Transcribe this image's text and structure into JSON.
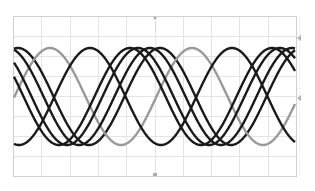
{
  "chart_data": {
    "type": "line",
    "title": "",
    "xlabel": "",
    "ylabel": "",
    "grid": true,
    "legend": null,
    "plot_frame_px": {
      "left": 13,
      "top": 16,
      "right": 296,
      "bottom": 176
    },
    "grid_divisions": {
      "x": 10,
      "y": 8
    },
    "waveform": "sine",
    "period_px": 142,
    "center_y_px": 96.5,
    "amplitude_px": 48.5,
    "series": [
      {
        "name": "trace-1",
        "color": "#1a1a1a",
        "peak_x_px": 18
      },
      {
        "name": "trace-2",
        "color": "#999999",
        "peak_x_px": 50
      },
      {
        "name": "trace-3",
        "color": "#1a1a1a",
        "peak_x_px": 90
      },
      {
        "name": "trace-4",
        "color": "#1a1a1a",
        "peak_x_px": 130
      },
      {
        "name": "trace-5",
        "color": "#1a1a1a",
        "peak_x_px": 138
      },
      {
        "name": "trace-6",
        "color": "#1a1a1a",
        "peak_x_px": 150
      }
    ],
    "markers": [
      {
        "name": "top-center-trigger-marker",
        "x_px": 155,
        "y_px": 17
      },
      {
        "name": "bottom-center-marker",
        "x_px": 155,
        "y_px": 175
      },
      {
        "name": "right-level-marker-top",
        "x_px": 297,
        "y_px": 38
      },
      {
        "name": "right-level-marker-mid",
        "x_px": 297,
        "y_px": 98
      }
    ]
  },
  "colors": {
    "grid": "#e4e4e4",
    "frame": "#d0d0d0",
    "marker": "#aaaaaa"
  }
}
